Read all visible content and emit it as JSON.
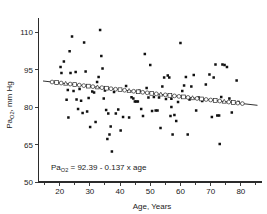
{
  "figure": {
    "background_color": "#ffffff",
    "ink_color": "#101010"
  },
  "chart_data": {
    "type": "scatter",
    "title": "",
    "xlabel": "Age, Years",
    "ylabel": "PaO2, mm Hg",
    "ylabel_main": "Pa",
    "ylabel_sub": "O2",
    "ylabel_tail": ", mm Hg",
    "xlim": [
      13,
      87
    ],
    "ylim": [
      50,
      114
    ],
    "xticks": [
      20,
      30,
      40,
      50,
      60,
      70,
      80
    ],
    "xtick_labels": [
      "20",
      "30",
      "40",
      "50",
      "60",
      "70",
      "80"
    ],
    "xminor_ticks": [
      15,
      25,
      35,
      45,
      55,
      65,
      75,
      85
    ],
    "yticks": [
      50,
      65,
      80,
      95,
      110
    ],
    "ytick_labels": [
      "50",
      "65",
      "80",
      "95",
      "110"
    ],
    "grid": false,
    "legend": null,
    "annotation": {
      "prefix": "Pa",
      "subscript": "O2",
      "text": " = 92.39 - 0.137 x age",
      "full": "PaO2 = 92.39 - 0.137 x age",
      "x": 27,
      "y": 57.5
    },
    "regression": {
      "equation": "PaO2 = 92.39 - 0.137 x age",
      "intercept": 92.39,
      "slope": -0.137,
      "x_start": 14.5,
      "x_end": 85.5,
      "marker_style": "open-circle-square-triangle"
    },
    "series": [
      {
        "name": "Individual subjects",
        "marker": "filled-square",
        "points": [
          [
            20.3,
            96.0
          ],
          [
            20.6,
            93.6
          ],
          [
            21.4,
            98.2
          ],
          [
            22.3,
            82.9
          ],
          [
            22.7,
            86.8
          ],
          [
            22.9,
            75.8
          ],
          [
            23.3,
            102.3
          ],
          [
            23.6,
            93.6
          ],
          [
            24.1,
            108.2
          ],
          [
            24.6,
            86.4
          ],
          [
            25.3,
            94.0
          ],
          [
            25.6,
            83.0
          ],
          [
            26.1,
            79.2
          ],
          [
            26.6,
            87.2
          ],
          [
            27.1,
            82.5
          ],
          [
            27.6,
            77.6
          ],
          [
            28.1,
            105.8
          ],
          [
            28.6,
            94.2
          ],
          [
            29.1,
            78.2
          ],
          [
            29.6,
            83.6
          ],
          [
            30.1,
            72.0
          ],
          [
            30.8,
            86.2
          ],
          [
            31.4,
            85.8
          ],
          [
            31.9,
            74.0
          ],
          [
            32.4,
            90.0
          ],
          [
            32.9,
            92.0
          ],
          [
            33.4,
            110.8
          ],
          [
            33.8,
            100.4
          ],
          [
            34.2,
            95.4
          ],
          [
            34.6,
            83.4
          ],
          [
            35.0,
            86.6
          ],
          [
            35.4,
            78.8
          ],
          [
            35.8,
            67.2
          ],
          [
            36.1,
            77.4
          ],
          [
            36.5,
            69.0
          ],
          [
            36.9,
            72.2
          ],
          [
            37.3,
            62.2
          ],
          [
            38.0,
            86.0
          ],
          [
            38.6,
            77.4
          ],
          [
            39.4,
            79.0
          ],
          [
            40.2,
            70.6
          ],
          [
            41.0,
            76.0
          ],
          [
            42.0,
            88.4
          ],
          [
            43.0,
            75.8
          ],
          [
            43.8,
            83.9
          ],
          [
            44.4,
            83.4
          ],
          [
            44.9,
            82.2
          ],
          [
            45.4,
            82.2
          ],
          [
            45.9,
            82.2
          ],
          [
            46.4,
            86.5
          ],
          [
            47.0,
            79.2
          ],
          [
            47.6,
            76.4
          ],
          [
            48.2,
            101.2
          ],
          [
            48.8,
            87.6
          ],
          [
            49.4,
            83.8
          ],
          [
            50.0,
            96.8
          ],
          [
            50.6,
            78.4
          ],
          [
            51.2,
            84.0
          ],
          [
            51.8,
            78.6
          ],
          [
            52.4,
            78.6
          ],
          [
            52.9,
            83.8
          ],
          [
            53.4,
            71.6
          ],
          [
            54.0,
            88.2
          ],
          [
            54.6,
            91.8
          ],
          [
            55.2,
            83.2
          ],
          [
            55.8,
            92.6
          ],
          [
            56.3,
            91.8
          ],
          [
            56.7,
            76.4
          ],
          [
            57.0,
            83.3
          ],
          [
            57.0,
            80.0
          ],
          [
            57.4,
            69.0
          ],
          [
            58.0,
            76.8
          ],
          [
            58.6,
            74.4
          ],
          [
            59.2,
            82.0
          ],
          [
            60.0,
            105.6
          ],
          [
            60.6,
            86.4
          ],
          [
            61.2,
            88.6
          ],
          [
            61.8,
            92.0
          ],
          [
            62.4,
            69.0
          ],
          [
            63.0,
            83.0
          ],
          [
            63.6,
            88.2
          ],
          [
            64.4,
            92.8
          ],
          [
            65.2,
            78.6
          ],
          [
            66.0,
            83.8
          ],
          [
            67.2,
            82.4
          ],
          [
            68.4,
            89.0
          ],
          [
            69.6,
            93.0
          ],
          [
            70.4,
            76.0
          ],
          [
            71.0,
            91.8
          ],
          [
            71.6,
            97.0
          ],
          [
            72.2,
            76.6
          ],
          [
            72.8,
            76.6
          ],
          [
            73.0,
            65.2
          ],
          [
            73.5,
            84.0
          ],
          [
            73.9,
            97.0
          ],
          [
            74.6,
            96.8
          ],
          [
            75.4,
            96.0
          ],
          [
            76.2,
            83.4
          ],
          [
            77.0,
            77.8
          ],
          [
            78.6,
            90.6
          ],
          [
            79.2,
            82.0
          ]
        ]
      },
      {
        "name": "Regression fit overlay markers",
        "marker": "open-mixed",
        "points": [
          [
            17.5,
            90.0
          ],
          [
            19.0,
            89.8
          ],
          [
            20.5,
            89.6
          ],
          [
            22.0,
            89.4
          ],
          [
            23.5,
            89.2
          ],
          [
            25.0,
            89.0
          ],
          [
            26.5,
            88.8
          ],
          [
            28.0,
            88.6
          ],
          [
            29.5,
            88.4
          ],
          [
            31.0,
            88.1
          ],
          [
            32.5,
            87.9
          ],
          [
            34.0,
            87.7
          ],
          [
            35.5,
            87.5
          ],
          [
            37.0,
            87.3
          ],
          [
            38.5,
            87.1
          ],
          [
            40.0,
            86.9
          ],
          [
            41.5,
            86.7
          ],
          [
            43.0,
            86.5
          ],
          [
            44.5,
            86.3
          ],
          [
            46.0,
            86.1
          ],
          [
            47.5,
            85.9
          ],
          [
            49.0,
            85.7
          ],
          [
            50.5,
            85.5
          ],
          [
            52.0,
            85.2
          ],
          [
            53.5,
            85.0
          ],
          [
            55.0,
            84.8
          ],
          [
            56.5,
            84.6
          ],
          [
            58.0,
            84.4
          ],
          [
            59.5,
            84.2
          ],
          [
            61.0,
            84.0
          ],
          [
            62.5,
            83.8
          ],
          [
            64.0,
            83.6
          ],
          [
            65.5,
            83.4
          ],
          [
            67.0,
            83.2
          ],
          [
            68.5,
            83.0
          ],
          [
            70.0,
            82.8
          ],
          [
            71.5,
            82.6
          ],
          [
            73.0,
            82.4
          ],
          [
            74.5,
            82.1
          ],
          [
            76.0,
            81.9
          ],
          [
            77.5,
            81.7
          ],
          [
            79.0,
            81.5
          ],
          [
            80.5,
            81.3
          ]
        ]
      }
    ]
  }
}
